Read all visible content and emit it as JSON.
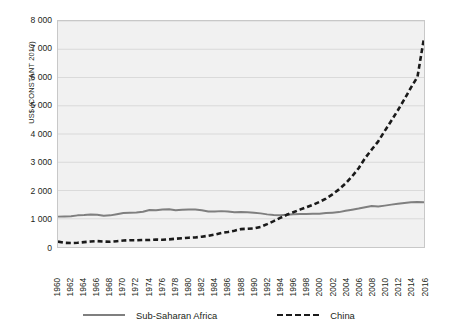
{
  "chart_data": {
    "type": "line",
    "title": "",
    "xlabel": "",
    "ylabel": "US$ (CONSTANT 2010)",
    "ylim": [
      0,
      8000
    ],
    "xlim": [
      1960,
      2016
    ],
    "grid": true,
    "legend_position": "bottom",
    "y_ticks": [
      "0",
      "1 000",
      "2 000",
      "3 000",
      "4 000",
      "5 000",
      "6 000",
      "7 000",
      "8 000"
    ],
    "y_tick_values": [
      0,
      1000,
      2000,
      3000,
      4000,
      5000,
      6000,
      7000,
      8000
    ],
    "x_tick_labels": [
      "1960",
      "1962",
      "1964",
      "1966",
      "1968",
      "1970",
      "1972",
      "1974",
      "1976",
      "1978",
      "1980",
      "1982",
      "1984",
      "1986",
      "1988",
      "1990",
      "1992",
      "1994",
      "1996",
      "1998",
      "2000",
      "2002",
      "2004",
      "2006",
      "2008",
      "2010",
      "2012",
      "2014",
      "2016"
    ],
    "x": [
      1960,
      1961,
      1962,
      1963,
      1964,
      1965,
      1966,
      1967,
      1968,
      1969,
      1970,
      1971,
      1972,
      1973,
      1974,
      1975,
      1976,
      1977,
      1978,
      1979,
      1980,
      1981,
      1982,
      1983,
      1984,
      1985,
      1986,
      1987,
      1988,
      1989,
      1990,
      1991,
      1992,
      1993,
      1994,
      1995,
      1996,
      1997,
      1998,
      1999,
      2000,
      2001,
      2002,
      2003,
      2004,
      2005,
      2006,
      2007,
      2008,
      2009,
      2010,
      2011,
      2012,
      2013,
      2014,
      2015,
      2016
    ],
    "series": [
      {
        "name": "Sub-Saharan Africa",
        "color": "#7f7f7f",
        "style": "solid",
        "values": [
          1075,
          1080,
          1090,
          1120,
          1130,
          1150,
          1140,
          1110,
          1120,
          1160,
          1200,
          1215,
          1220,
          1250,
          1310,
          1300,
          1330,
          1335,
          1300,
          1320,
          1330,
          1330,
          1300,
          1255,
          1260,
          1270,
          1255,
          1230,
          1235,
          1230,
          1210,
          1190,
          1155,
          1135,
          1125,
          1140,
          1160,
          1170,
          1170,
          1175,
          1180,
          1200,
          1215,
          1235,
          1280,
          1320,
          1360,
          1410,
          1450,
          1435,
          1465,
          1500,
          1530,
          1555,
          1585,
          1595,
          1585
        ]
      },
      {
        "name": "China",
        "color": "#1a1a1a",
        "style": "dashed",
        "values": [
          192,
          148,
          139,
          150,
          172,
          194,
          208,
          194,
          183,
          203,
          228,
          240,
          238,
          251,
          249,
          265,
          255,
          270,
          294,
          309,
          329,
          339,
          364,
          398,
          441,
          495,
          531,
          577,
          633,
          646,
          661,
          713,
          810,
          916,
          1029,
          1139,
          1230,
          1322,
          1407,
          1495,
          1595,
          1715,
          1865,
          2040,
          2250,
          2500,
          2790,
          3150,
          3450,
          3740,
          4110,
          4470,
          4840,
          5230,
          5640,
          6020,
          7400
        ]
      }
    ]
  },
  "legend": {
    "items": [
      {
        "label": "Sub-Saharan Africa"
      },
      {
        "label": "China"
      }
    ]
  }
}
